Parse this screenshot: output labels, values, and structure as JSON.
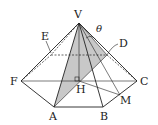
{
  "figure": {
    "type": "hexagonal pyramid",
    "labels": {
      "V": "V",
      "A": "A",
      "B": "B",
      "C": "C",
      "D": "D",
      "E": "E",
      "F": "F",
      "H": "H",
      "M": "M",
      "theta": "θ"
    },
    "colors": {
      "line": "#222222",
      "shade": "#c8c8c8",
      "background": "#ffffff"
    }
  }
}
